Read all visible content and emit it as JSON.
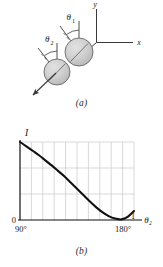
{
  "figure": {
    "panel_a": {
      "caption": "(a)",
      "axis_labels": {
        "x": "x",
        "y": "y"
      },
      "angle_labels": {
        "theta1": "θ",
        "theta1_sub": "1",
        "theta2": "θ",
        "theta2_sub": "2"
      },
      "balls": [
        {
          "name": "upper-ball",
          "cx": 79,
          "cy": 52,
          "r": 14
        },
        {
          "name": "lower-ball",
          "cx": 57,
          "cy": 72,
          "r": 13
        }
      ],
      "colors": {
        "ball_fill": "#c9c9c9",
        "ball_stroke": "#5a5a5a",
        "line": "#3a3a3a"
      }
    },
    "panel_b": {
      "caption": "(b)",
      "colors": {
        "curve": "#111111",
        "axis": "#111111",
        "grid": "#c8c8c8"
      }
    }
  },
  "chart_data": {
    "type": "line",
    "title": "",
    "xlabel": "θ₂",
    "ylabel": "I",
    "x_tick_labels": [
      "90°",
      "180°"
    ],
    "y_tick_labels": [
      "0",
      "1"
    ],
    "xlim": [
      90,
      180
    ],
    "ylim": [
      0,
      1
    ],
    "grid": true,
    "legend": "none",
    "x_gridline_count": 9,
    "y_gridline_count": 3,
    "annotations": [
      "I",
      "0",
      "1",
      "90°",
      "180°",
      "θ₂"
    ],
    "x": [
      90,
      95,
      100,
      105,
      110,
      115,
      120,
      125,
      130,
      135,
      140,
      145,
      150,
      155,
      160,
      165,
      170,
      175,
      180
    ],
    "y": [
      1.0,
      0.945,
      0.888,
      0.83,
      0.765,
      0.7,
      0.63,
      0.56,
      0.48,
      0.4,
      0.32,
      0.24,
      0.165,
      0.1,
      0.05,
      0.018,
      0.008,
      0.04,
      0.115
    ]
  }
}
